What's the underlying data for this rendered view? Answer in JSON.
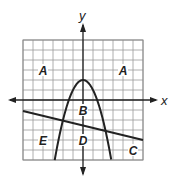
{
  "diagram": {
    "axes": {
      "x_label": "x",
      "y_label": "y"
    },
    "grid": {
      "xmin": -6,
      "xmax": 6,
      "ymin": -6,
      "ymax": 6,
      "step": 1
    },
    "curves": [
      {
        "name": "parabola",
        "equation": "y = -x^2 + 2",
        "vertex": [
          0,
          2
        ]
      },
      {
        "name": "line",
        "equation": "y = -0.25x - 2.5"
      }
    ],
    "regions": [
      {
        "label": "A",
        "pos": [
          -4,
          3
        ]
      },
      {
        "label": "A",
        "pos": [
          4,
          3
        ]
      },
      {
        "label": "B",
        "pos": [
          0,
          -1
        ]
      },
      {
        "label": "C",
        "pos": [
          5,
          -5
        ]
      },
      {
        "label": "D",
        "pos": [
          0,
          -4
        ]
      },
      {
        "label": "E",
        "pos": [
          -4,
          -4
        ]
      }
    ],
    "colors": {
      "grid": "#9a9a9a",
      "ink": "#222222"
    }
  }
}
